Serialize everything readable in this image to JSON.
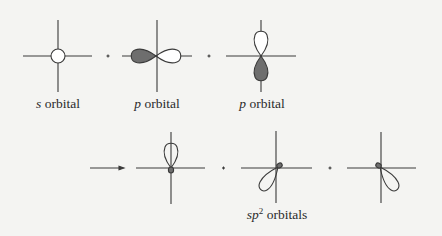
{
  "colors": {
    "line": "#3a3a3a",
    "shaded_lobe": "#6e6e6e",
    "background": "#f4f4f2"
  },
  "row1": {
    "orbitals": [
      {
        "name": "s",
        "italic": "s",
        "text": " orbital",
        "cx": 58
      },
      {
        "name": "p-horizontal",
        "italic": "p",
        "text": " orbital",
        "cx": 156
      },
      {
        "name": "p-vertical",
        "italic": "p",
        "text": " orbital",
        "cx": 261
      }
    ],
    "operators": [
      "+",
      "+"
    ]
  },
  "row2": {
    "arrow": "→",
    "operators": [
      "+",
      "+"
    ],
    "label": {
      "italic": "sp",
      "sup": "2",
      "text": " orbitals"
    }
  }
}
